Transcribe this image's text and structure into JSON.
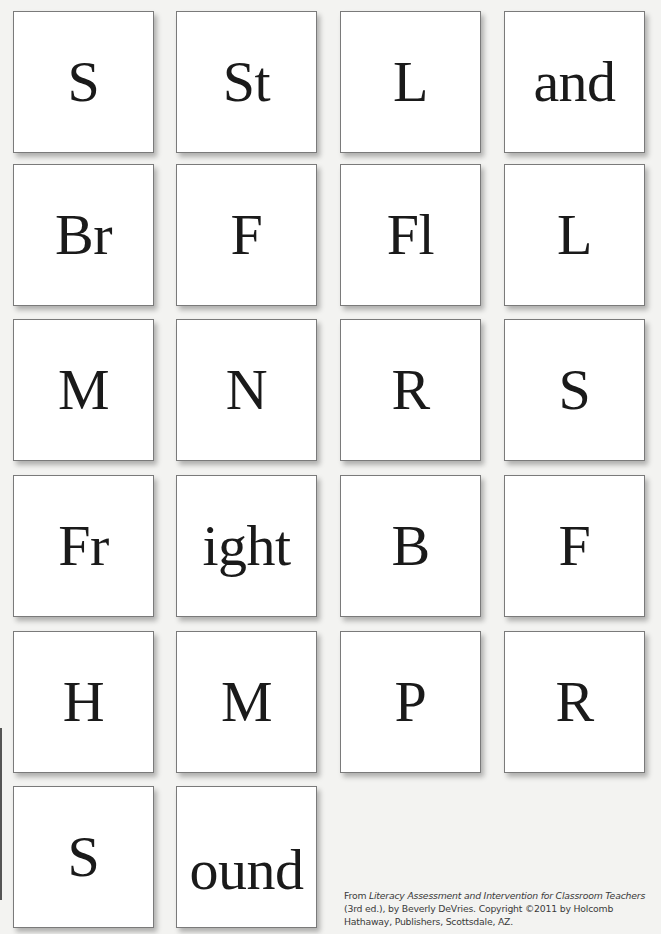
{
  "cards": [
    {
      "text": "S"
    },
    {
      "text": "St"
    },
    {
      "text": "L"
    },
    {
      "text": "and"
    },
    {
      "text": "Br"
    },
    {
      "text": "F"
    },
    {
      "text": "Fl"
    },
    {
      "text": "L"
    },
    {
      "text": "M"
    },
    {
      "text": "N"
    },
    {
      "text": "R"
    },
    {
      "text": "S"
    },
    {
      "text": "Fr"
    },
    {
      "text": "ight"
    },
    {
      "text": "B"
    },
    {
      "text": "F"
    },
    {
      "text": "H"
    },
    {
      "text": "M"
    },
    {
      "text": "P"
    },
    {
      "text": "R"
    },
    {
      "text": "S"
    },
    {
      "text": "ound"
    }
  ],
  "citation": {
    "prefix": "From ",
    "title": "Literacy Assessment and Intervention for Classroom Teachers",
    "rest": " (3rd ed.), by Beverly DeVries. Copyright ©2011 by Holcomb Hathaway, Publishers, Scottsdale, AZ."
  },
  "colors": {
    "page_background": "#f3f3f1",
    "card_background": "#ffffff",
    "card_border": "#7a7a7a",
    "text": "#1a1a1a"
  }
}
